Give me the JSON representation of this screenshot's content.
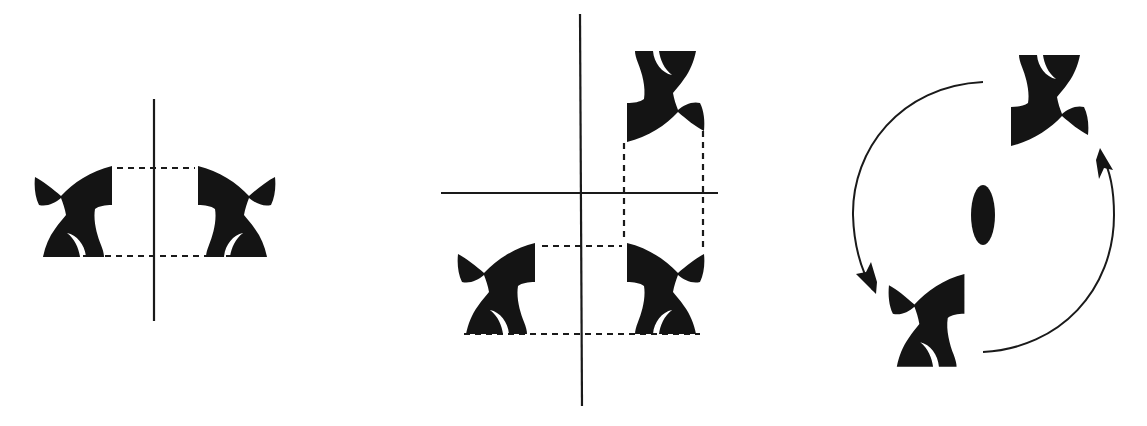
{
  "colors": {
    "ink": "#141414",
    "background": "#ffffff"
  },
  "panels": [
    {
      "id": "mirror",
      "label": "Reflection across a mirror line",
      "motifs": 2,
      "mirror_lines": 1
    },
    {
      "id": "two-mirrors",
      "label": "Reflection across two perpendicular mirror lines",
      "motifs": 3,
      "mirror_lines": 2
    },
    {
      "id": "rotation",
      "label": "Two-fold rotation about a rotation axis",
      "motifs": 2,
      "rotation_symbol": "ellipse",
      "arrows": 2
    }
  ]
}
